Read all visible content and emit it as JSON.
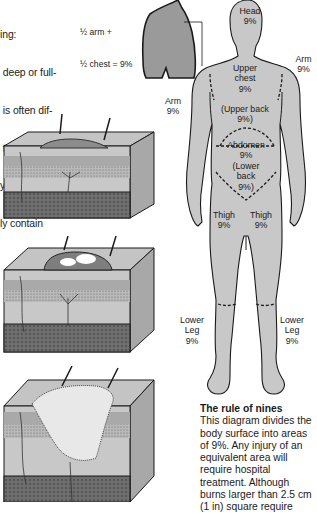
{
  "intro_text": {
    "lines": [
      "ing:",
      " deep or full-",
      " is often dif-",
      " the different",
      "y stages. A",
      "ly contain"
    ]
  },
  "inset": {
    "label_line1": "½ arm +",
    "label_line2": "½ chest = 9%"
  },
  "body_regions": {
    "head": {
      "name": "Head",
      "pct": "9%"
    },
    "upper_chest": {
      "name": "Upper",
      "name2": "chest",
      "pct": "9%"
    },
    "upper_back": {
      "name": "(Upper back",
      "pct": "9%)"
    },
    "abdomen": {
      "name": "Abdomen",
      "pct": "9%"
    },
    "lower_back": {
      "name": "(Lower",
      "name2": "back",
      "pct": "9%)"
    },
    "arm_left": {
      "name": "Arm",
      "pct": "9%"
    },
    "arm_right": {
      "name": "Arm",
      "pct": "9%"
    },
    "thigh_left": {
      "name": "Thigh",
      "pct": "9%"
    },
    "thigh_right": {
      "name": "Thigh",
      "pct": "9%"
    },
    "lower_leg_left": {
      "name": "Lower",
      "name2": "Leg",
      "pct": "9%"
    },
    "lower_leg_right": {
      "name": "Lower",
      "name2": "Leg",
      "pct": "9%"
    }
  },
  "skin_diagrams": [
    {
      "stage": "superficial burn"
    },
    {
      "stage": "partial-thickness burn with blisters"
    },
    {
      "stage": "full-thickness burn"
    }
  ],
  "caption": {
    "title": "The rule of nines",
    "body": "This diagram divides the body surface into areas of 9%. Any injury of an equivalent area will require hospital treatment. Although burns larger than 2.5 cm (1 in) square require"
  },
  "colors": {
    "body_fill": "#c8c8c8",
    "inset_fill": "#9a9a9a",
    "outline": "#1a1a1a"
  }
}
